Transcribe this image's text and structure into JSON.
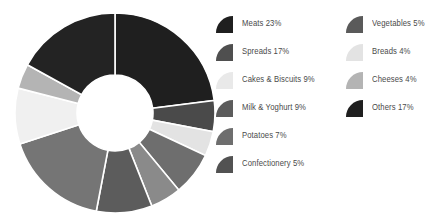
{
  "chart_data": {
    "type": "pie",
    "variant": "donut",
    "title": "",
    "subtitle": "",
    "xlabel": "",
    "ylabel": "",
    "grid": false,
    "legend_position": "right",
    "legend_columns": 2,
    "value_unit": "%",
    "total": 100,
    "start_angle_deg": 0,
    "direction": "clockwise",
    "inner_radius_ratio": 0.38,
    "slice_gap_color": "#ffffff",
    "categories": [
      "Meats",
      "Vegetables",
      "Breads",
      "Potatoes",
      "Confectionery",
      "Milk & Yoghurt",
      "Spreads",
      "Cakes & Biscuits",
      "Cheeses",
      "Others"
    ],
    "values": [
      23,
      5,
      4,
      7,
      5,
      9,
      17,
      9,
      4,
      17
    ],
    "labels": [
      "Meats 23%",
      "Vegetables 5%",
      "Breads 4%",
      "Potatoes 7%",
      "Confectionery 5%",
      "Milk & Yoghurt 9%",
      "Spreads 17%",
      "Cakes & Biscuits 9%",
      "Cheeses 4%",
      "Others 17%"
    ],
    "colors": [
      "#1f1f1f",
      "#4a4a4a",
      "#e3e3e3",
      "#6e6e6e",
      "#8a8a8a",
      "#5c5c5c",
      "#757575",
      "#f0f0f0",
      "#b4b4b4",
      "#232323"
    ]
  },
  "legend": {
    "columns": [
      {
        "items": [
          {
            "label": "Meats 23%",
            "name": "Meats",
            "value": 23,
            "color": "#1f1f1f"
          },
          {
            "label": "Spreads 17%",
            "name": "Spreads",
            "value": 17,
            "color": "#4f4f4f"
          },
          {
            "label": "Cakes & Biscuits 9%",
            "name": "Cakes & Biscuits",
            "value": 9,
            "color": "#e9e9e9"
          },
          {
            "label": "Milk & Yoghurt 9%",
            "name": "Milk & Yoghurt",
            "value": 9,
            "color": "#5c5c5c"
          },
          {
            "label": "Potatoes 7%",
            "name": "Potatoes",
            "value": 7,
            "color": "#6e6e6e"
          },
          {
            "label": "Confectionery 5%",
            "name": "Confectionery",
            "value": 5,
            "color": "#525252"
          }
        ]
      },
      {
        "items": [
          {
            "label": "Vegetables 5%",
            "name": "Vegetables",
            "value": 5,
            "color": "#5a5a5a"
          },
          {
            "label": "Breads 4%",
            "name": "Breads",
            "value": 4,
            "color": "#e3e3e3"
          },
          {
            "label": "Cheeses 4%",
            "name": "Cheeses",
            "value": 4,
            "color": "#b4b4b4"
          },
          {
            "label": "Others 17%",
            "name": "Others",
            "value": 17,
            "color": "#1f1f1f"
          }
        ]
      }
    ]
  },
  "style": {
    "background": "#ffffff",
    "text_color": "#4a4a4a"
  }
}
